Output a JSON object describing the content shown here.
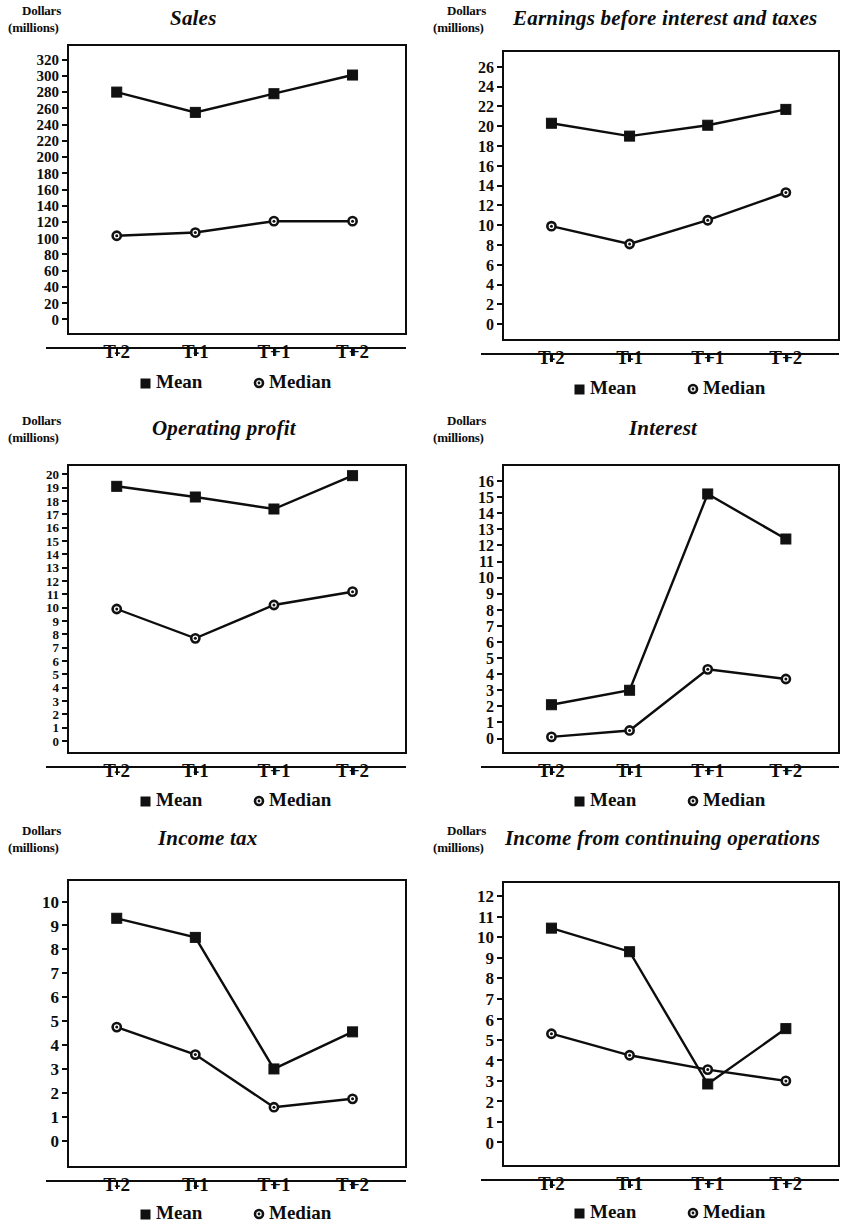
{
  "figure": {
    "axis_unit_line1": "Dollars",
    "axis_unit_line2": "(millions)",
    "legend": {
      "mean_label": "Mean",
      "median_label": "Median",
      "mean_marker": "filled-square",
      "median_marker": "open-circle"
    },
    "line_color": "#0d0d0d",
    "background_color": "#ffffff"
  },
  "chart_data": [
    {
      "id": "sales",
      "type": "line",
      "title": "Sales",
      "xlabel": "",
      "ylabel": "Dollars (millions)",
      "categories": [
        "T-2",
        "T-1",
        "T+1",
        "T+2"
      ],
      "yticks": [
        0,
        20,
        40,
        60,
        80,
        100,
        120,
        140,
        160,
        180,
        200,
        220,
        240,
        260,
        280,
        300,
        320
      ],
      "ylim": [
        -18,
        338
      ],
      "grid": false,
      "legend_position": "below",
      "series": [
        {
          "name": "Mean",
          "marker": "square",
          "values": [
            280,
            255,
            278,
            301
          ]
        },
        {
          "name": "Median",
          "marker": "circle",
          "values": [
            103,
            107,
            121,
            121
          ]
        }
      ]
    },
    {
      "id": "ebit",
      "type": "line",
      "title": "Earnings before interest and taxes",
      "xlabel": "",
      "ylabel": "Dollars (millions)",
      "categories": [
        "T-2",
        "T-1",
        "T+1",
        "T+2"
      ],
      "yticks": [
        0,
        2,
        4,
        6,
        8,
        10,
        12,
        14,
        16,
        18,
        20,
        22,
        24,
        26
      ],
      "ylim": [
        -1.6,
        27.6
      ],
      "grid": false,
      "legend_position": "below",
      "series": [
        {
          "name": "Mean",
          "marker": "square",
          "values": [
            20.3,
            19.0,
            20.1,
            21.7
          ]
        },
        {
          "name": "Median",
          "marker": "circle",
          "values": [
            9.9,
            8.1,
            10.5,
            13.3
          ]
        }
      ]
    },
    {
      "id": "operating-profit",
      "type": "line",
      "title": "Operating profit",
      "xlabel": "",
      "ylabel": "Dollars (millions)",
      "categories": [
        "T-2",
        "T-1",
        "T+1",
        "T+2"
      ],
      "yticks": [
        0,
        1,
        2,
        3,
        4,
        5,
        6,
        7,
        8,
        9,
        10,
        11,
        12,
        13,
        14,
        15,
        16,
        17,
        18,
        19,
        20
      ],
      "ylim": [
        -0.9,
        20.7
      ],
      "grid": false,
      "legend_position": "below",
      "series": [
        {
          "name": "Mean",
          "marker": "square",
          "values": [
            19.1,
            18.3,
            17.4,
            19.9
          ]
        },
        {
          "name": "Median",
          "marker": "circle",
          "values": [
            9.9,
            7.7,
            10.2,
            11.2
          ]
        }
      ]
    },
    {
      "id": "interest",
      "type": "line",
      "title": "Interest",
      "xlabel": "",
      "ylabel": "Dollars (millions)",
      "categories": [
        "T-2",
        "T-1",
        "T+1",
        "T+2"
      ],
      "yticks": [
        0,
        1,
        2,
        3,
        4,
        5,
        6,
        7,
        8,
        9,
        10,
        11,
        12,
        13,
        14,
        15,
        16
      ],
      "ylim": [
        -0.9,
        17.0
      ],
      "grid": false,
      "legend_position": "below",
      "series": [
        {
          "name": "Mean",
          "marker": "square",
          "values": [
            2.1,
            3.0,
            15.2,
            12.4
          ]
        },
        {
          "name": "Median",
          "marker": "circle",
          "values": [
            0.1,
            0.5,
            4.3,
            3.7
          ]
        }
      ]
    },
    {
      "id": "income-tax",
      "type": "line",
      "title": "Income tax",
      "xlabel": "",
      "ylabel": "Dollars (millions)",
      "categories": [
        "T-2",
        "T-1",
        "T+1",
        "T+2"
      ],
      "yticks": [
        0,
        1,
        2,
        3,
        4,
        5,
        6,
        7,
        8,
        9,
        10
      ],
      "ylim": [
        -1.1,
        10.9
      ],
      "grid": false,
      "legend_position": "below",
      "series": [
        {
          "name": "Mean",
          "marker": "square",
          "values": [
            9.3,
            8.5,
            3.0,
            4.55
          ]
        },
        {
          "name": "Median",
          "marker": "circle",
          "values": [
            4.75,
            3.6,
            1.4,
            1.75
          ]
        }
      ]
    },
    {
      "id": "income-continuing-operations",
      "type": "line",
      "title": "Income from continuing operations",
      "xlabel": "",
      "ylabel": "Dollars (millions)",
      "categories": [
        "T-2",
        "T-1",
        "T+1",
        "T+2"
      ],
      "yticks": [
        0,
        1,
        2,
        3,
        4,
        5,
        6,
        7,
        8,
        9,
        10,
        11,
        12
      ],
      "ylim": [
        -1.15,
        12.7
      ],
      "grid": false,
      "legend_position": "below",
      "series": [
        {
          "name": "Mean",
          "marker": "square",
          "values": [
            10.45,
            9.3,
            2.85,
            5.55
          ]
        },
        {
          "name": "Median",
          "marker": "circle",
          "values": [
            5.3,
            4.25,
            3.55,
            3.0
          ]
        }
      ]
    }
  ]
}
